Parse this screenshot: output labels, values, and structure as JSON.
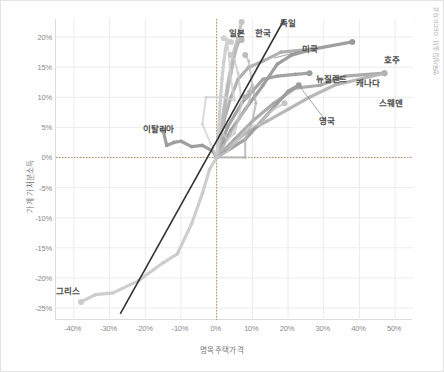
{
  "chart_data": {
    "type": "line",
    "title": "",
    "xlabel": "명목주택가격",
    "ylabel": "가계 가처분소득",
    "source_note": "명목/실질 출처 : OECD 자료",
    "xlim": [
      -45,
      55
    ],
    "ylim": [
      -27,
      23
    ],
    "xticks": [
      "-40%",
      "-30%",
      "-20%",
      "-10%",
      "0%",
      "10%",
      "20%",
      "30%",
      "40%",
      "50%"
    ],
    "xtick_values": [
      -40,
      -30,
      -20,
      -10,
      0,
      10,
      20,
      30,
      40,
      50
    ],
    "yticks": [
      "20%",
      "15%",
      "10%",
      "5%",
      "0%",
      "-5%",
      "-10%",
      "-15%",
      "-20%",
      "-25%"
    ],
    "ytick_values": [
      20,
      15,
      10,
      5,
      0,
      -5,
      -10,
      -15,
      -20,
      -25
    ],
    "grid": true,
    "legend": "none",
    "reference_line": {
      "name": "45-degree-parity-line",
      "color": "#333333",
      "from": [
        -27,
        -26
      ],
      "to": [
        19,
        23
      ]
    },
    "zero_lines": {
      "x": 0,
      "y": 0,
      "style": "dotted",
      "color": "#b08f5a"
    },
    "series": [
      {
        "name": "호주",
        "label": "호주",
        "color": "#9a9a9a",
        "label_x": 383,
        "label_y": 55,
        "points": [
          [
            0,
            0
          ],
          [
            4,
            4.5
          ],
          [
            8,
            8
          ],
          [
            13,
            12
          ],
          [
            17,
            15.5
          ],
          [
            21,
            17
          ],
          [
            27,
            18
          ],
          [
            38,
            19.2
          ]
        ],
        "endpoint": [
          38,
          19.2
        ]
      },
      {
        "name": "캐나다",
        "label": "캐나다",
        "color": "#a6a6a6",
        "label_x": 355,
        "label_y": 78,
        "points": [
          [
            0,
            0
          ],
          [
            5,
            3
          ],
          [
            10,
            6
          ],
          [
            16,
            9
          ],
          [
            22,
            11.5
          ],
          [
            29,
            12
          ],
          [
            36,
            13.5
          ],
          [
            47,
            14
          ]
        ],
        "endpoint": [
          47,
          14
        ]
      },
      {
        "name": "스웨덴",
        "label": "스웨덴",
        "color": "#b4b4b4",
        "label_x": 378,
        "label_y": 98,
        "points": [
          [
            0,
            0
          ],
          [
            4,
            2
          ],
          [
            8,
            4
          ],
          [
            14,
            6
          ],
          [
            20,
            8
          ],
          [
            26,
            10
          ],
          [
            33,
            12
          ],
          [
            47,
            14
          ]
        ],
        "endpoint": [
          47,
          14
        ]
      },
      {
        "name": "뉴질랜드",
        "label": "뉴질랜드",
        "color": "#9e9e9e",
        "label_x": 315,
        "label_y": 74,
        "points": [
          [
            0,
            0
          ],
          [
            3,
            5
          ],
          [
            7,
            9
          ],
          [
            10,
            11
          ],
          [
            13,
            13
          ],
          [
            17,
            13.5
          ],
          [
            22,
            13.8
          ],
          [
            26,
            14
          ]
        ],
        "endpoint": [
          26,
          14
        ]
      },
      {
        "name": "미국",
        "label": "미국",
        "color": "#adadad",
        "label_x": 301,
        "label_y": 44,
        "points": [
          [
            0,
            0
          ],
          [
            2,
            6
          ],
          [
            4,
            10
          ],
          [
            6,
            13
          ],
          [
            9,
            15
          ],
          [
            13,
            16
          ],
          [
            18,
            17.5
          ],
          [
            27,
            18
          ]
        ],
        "endpoint": [
          27,
          18
        ]
      },
      {
        "name": "독일",
        "label": "독일",
        "color": "#c4c4c4",
        "label_x": 279,
        "label_y": 18,
        "points": [
          [
            0,
            0
          ],
          [
            1,
            4
          ],
          [
            2,
            8
          ],
          [
            3,
            12
          ],
          [
            4,
            15
          ],
          [
            5,
            18
          ],
          [
            6,
            20
          ],
          [
            7,
            22.5
          ]
        ],
        "endpoint": [
          7,
          22.5
        ]
      },
      {
        "name": "한국",
        "label": "한국",
        "color": "#b8b8b8",
        "label_x": 254,
        "label_y": 28,
        "points": [
          [
            0,
            0
          ],
          [
            1,
            3
          ],
          [
            2,
            7
          ],
          [
            3,
            11
          ],
          [
            4,
            14
          ],
          [
            5,
            17
          ],
          [
            6,
            19
          ],
          [
            7,
            19.5
          ]
        ],
        "endpoint": [
          7,
          19.5
        ]
      },
      {
        "name": "일본",
        "label": "일본",
        "color": "#cdcdcd",
        "label_x": 228,
        "label_y": 28,
        "points": [
          [
            0,
            0
          ],
          [
            0.5,
            4
          ],
          [
            1,
            9
          ],
          [
            1.5,
            13
          ],
          [
            2,
            16
          ],
          [
            2.5,
            18
          ],
          [
            3,
            19.5
          ],
          [
            4,
            19.2
          ]
        ],
        "endpoint": [
          4,
          19.2
        ]
      },
      {
        "name": "영국",
        "label": "영국",
        "color": "#9c9c9c",
        "label_x": 318,
        "label_y": 116,
        "points": [
          [
            0,
            0
          ],
          [
            4,
            1.5
          ],
          [
            8,
            3
          ],
          [
            11,
            5
          ],
          [
            14,
            7
          ],
          [
            17,
            9
          ],
          [
            20,
            11
          ],
          [
            23,
            12
          ]
        ],
        "endpoint": [
          23,
          12
        ]
      },
      {
        "name": "이탈리아",
        "label": "이탈리아",
        "color": "#9b9b9b",
        "label_x": 142,
        "label_y": 124,
        "points": [
          [
            -15,
            4.5
          ],
          [
            -14,
            2
          ],
          [
            -12,
            2.5
          ],
          [
            -10,
            2.7
          ],
          [
            -7,
            1.8
          ],
          [
            -4,
            2
          ],
          [
            -1,
            1
          ],
          [
            0,
            0
          ]
        ],
        "endpoint": [
          -15,
          4.5
        ]
      },
      {
        "name": "그리스",
        "label": "그리스",
        "color": "#cbcbcb",
        "label_x": 55,
        "label_y": 286,
        "points": [
          [
            -38,
            -24
          ],
          [
            -34,
            -22.8
          ],
          [
            -29,
            -22.5
          ],
          [
            -22,
            -20.5
          ],
          [
            -15,
            -17.5
          ],
          [
            -11,
            -16
          ],
          [
            -7,
            -11
          ],
          [
            -4,
            -6
          ],
          [
            -2,
            -2
          ],
          [
            0,
            0
          ]
        ],
        "endpoint": [
          -38,
          -24
        ]
      },
      {
        "name": "기타-1",
        "label": "",
        "color": "#d2d2d2",
        "label_x": null,
        "label_y": null,
        "points": [
          [
            0,
            0
          ],
          [
            -4,
            5.5
          ],
          [
            -3,
            10
          ],
          [
            2,
            10
          ],
          [
            5,
            9.5
          ],
          [
            4,
            13
          ],
          [
            3,
            19.5
          ],
          [
            2,
            19.8
          ]
        ],
        "endpoint": [
          2,
          19.8
        ]
      },
      {
        "name": "기타-2",
        "label": "",
        "color": "#c8c8c8",
        "label_x": null,
        "label_y": null,
        "points": [
          [
            0,
            0
          ],
          [
            1,
            4.5
          ],
          [
            3,
            3
          ],
          [
            5,
            4
          ],
          [
            7,
            9
          ],
          [
            6,
            14
          ],
          [
            5,
            16
          ],
          [
            4,
            17
          ]
        ],
        "endpoint": [
          4,
          17
        ]
      },
      {
        "name": "기타-3",
        "label": "",
        "color": "#b0b0b0",
        "label_x": null,
        "label_y": null,
        "points": [
          [
            0,
            0
          ],
          [
            8,
            0
          ],
          [
            8,
            3
          ],
          [
            10,
            6
          ],
          [
            11,
            9
          ],
          [
            10,
            12
          ],
          [
            9,
            11
          ],
          [
            8,
            10
          ]
        ],
        "endpoint": [
          8,
          10
        ]
      },
      {
        "name": "기타-4",
        "label": "",
        "color": "#bdbdbd",
        "label_x": null,
        "label_y": null,
        "points": [
          [
            0,
            0
          ],
          [
            2,
            2
          ],
          [
            4,
            4
          ],
          [
            7,
            7
          ],
          [
            9,
            9
          ],
          [
            10,
            12
          ],
          [
            9,
            16
          ],
          [
            8,
            17
          ]
        ],
        "endpoint": [
          8,
          17
        ]
      },
      {
        "name": "기타-5",
        "label": "",
        "color": "#c6c6c6",
        "label_x": null,
        "label_y": null,
        "points": [
          [
            0,
            0
          ],
          [
            3,
            1
          ],
          [
            6,
            3
          ],
          [
            9,
            5
          ],
          [
            12,
            5.5
          ],
          [
            14,
            7
          ],
          [
            16,
            8
          ],
          [
            19,
            9
          ]
        ],
        "endpoint": [
          19,
          9
        ]
      }
    ]
  }
}
